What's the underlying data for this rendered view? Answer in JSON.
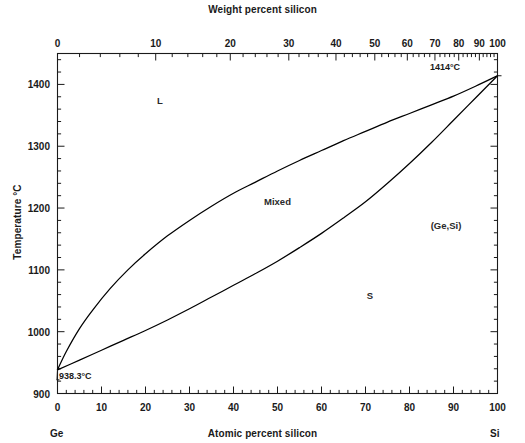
{
  "axes": {
    "top_title": "Weight percent silicon",
    "bottom_title": "Atomic percent silicon",
    "y_title": "Temperature °C",
    "left_end_label": "Ge",
    "right_end_label": "Si",
    "top_ticks": [
      {
        "label": "0",
        "frac": 0.0
      },
      {
        "label": "10",
        "frac": 0.2098
      },
      {
        "label": "20",
        "frac": 0.3899
      },
      {
        "label": "30",
        "frac": 0.5459
      },
      {
        "label": "40",
        "frac": 0.6625
      },
      {
        "label": "50",
        "frac": 0.7478
      },
      {
        "label": "60",
        "frac": 0.8136
      },
      {
        "label": "70",
        "frac": 0.8693
      },
      {
        "label": "80",
        "frac": 0.9172
      },
      {
        "label": "90",
        "frac": 0.96
      },
      {
        "label": "100",
        "frac": 1.0
      }
    ],
    "bottom_ticks": [
      "0",
      "10",
      "20",
      "30",
      "40",
      "50",
      "60",
      "70",
      "80",
      "90",
      "100"
    ],
    "y_ticks": [
      "900",
      "1000",
      "1100",
      "1200",
      "1300",
      "1400"
    ],
    "xlim": [
      0,
      100
    ],
    "ylim": [
      900,
      1450
    ]
  },
  "annotations": {
    "si_melting": "1414°C",
    "ge_melting": "938.3°C"
  },
  "phase_labels": [
    {
      "name": "liquid",
      "text": "L",
      "x": 23.3,
      "y": 1374
    },
    {
      "name": "mixed",
      "text": "Mixed",
      "x": 50.0,
      "y": 1212
    },
    {
      "name": "ge-si-solid-solution",
      "text": "(Ge,Si)",
      "x": 88.3,
      "y": 1172
    },
    {
      "name": "solid",
      "text": "S",
      "x": 71.0,
      "y": 1060
    }
  ],
  "chart_data": {
    "type": "line",
    "xlabel": "Atomic percent silicon",
    "ylabel": "Temperature °C",
    "xlim": [
      0,
      100
    ],
    "ylim": [
      900,
      1450
    ],
    "grid": false,
    "legend": null,
    "series": [
      {
        "name": "liquidus",
        "x": [
          0,
          2,
          5,
          8,
          12,
          16,
          20,
          25,
          30,
          35,
          40,
          45,
          50,
          55,
          60,
          65,
          70,
          75,
          80,
          85,
          90,
          95,
          100
        ],
        "y": [
          938.3,
          968,
          1005,
          1035,
          1070,
          1100,
          1126,
          1155,
          1180,
          1203,
          1224,
          1242,
          1260,
          1277,
          1293,
          1309,
          1324,
          1339,
          1353,
          1367,
          1381,
          1397,
          1414
        ]
      },
      {
        "name": "solidus",
        "x": [
          0,
          5,
          10,
          15,
          20,
          25,
          30,
          35,
          40,
          45,
          50,
          55,
          60,
          65,
          70,
          75,
          80,
          85,
          90,
          95,
          100
        ],
        "y": [
          938.3,
          954,
          970,
          986,
          1002,
          1019,
          1037,
          1056,
          1075,
          1094,
          1114,
          1136,
          1159,
          1184,
          1210,
          1240,
          1272,
          1306,
          1342,
          1378,
          1414
        ]
      }
    ],
    "annotated_points": [
      {
        "label": "938.3°C",
        "x": 0,
        "y": 938.3
      },
      {
        "label": "1414°C",
        "x": 100,
        "y": 1414
      }
    ]
  }
}
